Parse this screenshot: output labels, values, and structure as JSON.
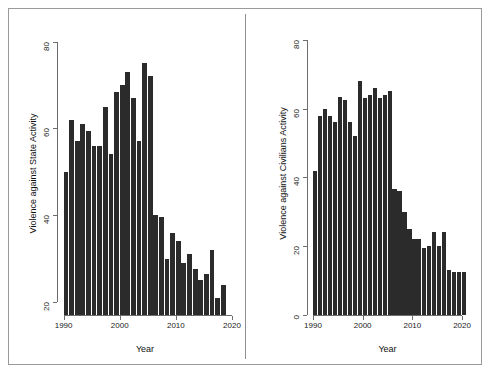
{
  "figure": {
    "background_color": "#ffffff",
    "bar_color": "#2b2b2b",
    "axis_color": "#6d6d6d",
    "frame_color": "#9a9a9a"
  },
  "chart_data": [
    {
      "type": "bar",
      "panel": "left",
      "title": "",
      "xlabel": "Year",
      "ylabel": "Violence against State Activity",
      "xlim": [
        1989,
        2020
      ],
      "ylim": [
        17,
        82
      ],
      "ybase": 17,
      "grid": false,
      "legend": false,
      "xticks": [
        1990,
        2000,
        2010,
        2020
      ],
      "xticklabels": [
        "1990",
        "2000",
        "2010",
        "2020"
      ],
      "yticks": [
        20,
        40,
        60,
        80
      ],
      "yticklabels": [
        "20",
        "40",
        "60",
        "80"
      ],
      "categories": [
        1990,
        1991,
        1992,
        1993,
        1994,
        1995,
        1996,
        1997,
        1998,
        1999,
        2000,
        2001,
        2002,
        2003,
        2004,
        2005,
        2006,
        2007,
        2008,
        2009,
        2010,
        2011,
        2012,
        2013,
        2014,
        2015,
        2016,
        2017,
        2018
      ],
      "values": [
        50,
        62,
        57,
        61,
        59.5,
        56,
        56,
        65,
        54,
        68.5,
        70,
        73,
        67,
        57,
        75,
        72,
        40,
        39.5,
        30,
        36,
        34,
        29,
        31,
        27.5,
        25,
        26.5,
        32,
        21,
        24
      ]
    },
    {
      "type": "bar",
      "panel": "right",
      "title": "",
      "xlabel": "Year",
      "ylabel": "Violence against Civilians Activity",
      "xlim": [
        1989,
        2021
      ],
      "ylim": [
        0,
        82
      ],
      "ybase": 0,
      "grid": false,
      "legend": false,
      "xticks": [
        1990,
        2000,
        2010,
        2020
      ],
      "xticklabels": [
        "1990",
        "2000",
        "2010",
        "2020"
      ],
      "yticks": [
        0,
        20,
        40,
        60,
        80
      ],
      "yticklabels": [
        "0",
        "20",
        "40",
        "60",
        "80"
      ],
      "categories": [
        1990,
        1991,
        1992,
        1993,
        1994,
        1995,
        1996,
        1997,
        1998,
        1999,
        2000,
        2001,
        2002,
        2003,
        2004,
        2005,
        2006,
        2007,
        2008,
        2009,
        2010,
        2011,
        2012,
        2013,
        2014,
        2015,
        2016,
        2017,
        2018,
        2019,
        2020
      ],
      "values": [
        42,
        58,
        60,
        58,
        56,
        63.5,
        62.5,
        56,
        52,
        68,
        63,
        64,
        66,
        63,
        64,
        65,
        36.5,
        36,
        30,
        25,
        22,
        22,
        19.5,
        20,
        24,
        20,
        24,
        13,
        12.5,
        12.5,
        12.5
      ]
    }
  ]
}
